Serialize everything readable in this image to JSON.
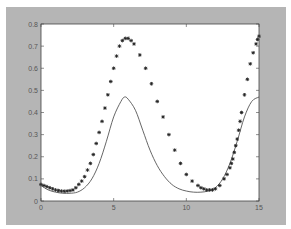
{
  "figure": {
    "frame_color": "#b5b5b5",
    "plot_bg": "#ffffff",
    "axis_color": "#444444",
    "line_color": "#555555",
    "marker_color": "#222222"
  },
  "chart_data": {
    "type": "line",
    "title": "",
    "xlabel": "",
    "ylabel": "",
    "xlim": [
      0,
      15
    ],
    "ylim": [
      0,
      0.8
    ],
    "grid": false,
    "legend": null,
    "xticks": [
      0,
      5,
      10,
      15
    ],
    "xtick_labels": [
      "0",
      "5",
      "10",
      "15"
    ],
    "yticks": [
      0,
      0.1,
      0.2,
      0.3,
      0.4,
      0.5,
      0.6,
      0.7,
      0.8
    ],
    "ytick_labels": [
      "0",
      "0.1",
      "0.2",
      "0.3",
      "0.4",
      "0.5",
      "0.6",
      "0.7",
      "0.8"
    ],
    "series": [
      {
        "name": "line",
        "style": "solid-line",
        "x": [
          0,
          0.5,
          1,
          1.5,
          2,
          2.5,
          3,
          3.5,
          4,
          4.5,
          5,
          5.5,
          5.75,
          6,
          6.5,
          7,
          7.5,
          8,
          8.5,
          9,
          9.5,
          10,
          10.5,
          11,
          11.5,
          12,
          12.5,
          13,
          13.5,
          14,
          14.5,
          15
        ],
        "values": [
          0.07,
          0.05,
          0.04,
          0.035,
          0.035,
          0.04,
          0.06,
          0.1,
          0.17,
          0.27,
          0.38,
          0.45,
          0.47,
          0.46,
          0.41,
          0.32,
          0.23,
          0.16,
          0.11,
          0.075,
          0.055,
          0.045,
          0.04,
          0.04,
          0.045,
          0.06,
          0.1,
          0.17,
          0.27,
          0.38,
          0.45,
          0.47
        ]
      },
      {
        "name": "markers",
        "style": "plus-markers",
        "x": [
          0,
          0.2,
          0.4,
          0.6,
          0.8,
          1.0,
          1.2,
          1.4,
          1.6,
          1.8,
          2.0,
          2.2,
          2.4,
          2.6,
          2.8,
          3.0,
          3.2,
          3.4,
          3.6,
          3.8,
          4.0,
          4.2,
          4.4,
          4.6,
          4.8,
          5.0,
          5.2,
          5.4,
          5.6,
          5.8,
          6.0,
          6.2,
          6.4,
          6.8,
          7.2,
          7.6,
          8.0,
          8.4,
          8.8,
          9.2,
          9.6,
          10.0,
          10.4,
          10.8,
          11.0,
          11.2,
          11.4,
          11.6,
          11.8,
          12.0,
          12.3,
          12.6,
          12.8,
          13.0,
          13.1,
          13.2,
          13.3,
          13.4,
          13.5,
          13.6,
          13.7,
          13.8,
          14.0,
          14.2,
          14.4,
          14.6,
          14.8,
          14.9,
          15.0
        ],
        "values": [
          0.075,
          0.07,
          0.065,
          0.06,
          0.055,
          0.05,
          0.047,
          0.045,
          0.044,
          0.045,
          0.047,
          0.05,
          0.06,
          0.075,
          0.09,
          0.11,
          0.14,
          0.17,
          0.21,
          0.26,
          0.31,
          0.36,
          0.42,
          0.48,
          0.54,
          0.6,
          0.655,
          0.7,
          0.725,
          0.735,
          0.735,
          0.725,
          0.71,
          0.66,
          0.6,
          0.53,
          0.45,
          0.38,
          0.3,
          0.23,
          0.17,
          0.12,
          0.09,
          0.07,
          0.06,
          0.055,
          0.05,
          0.05,
          0.05,
          0.055,
          0.07,
          0.1,
          0.12,
          0.15,
          0.17,
          0.19,
          0.22,
          0.25,
          0.28,
          0.32,
          0.36,
          0.4,
          0.48,
          0.55,
          0.62,
          0.67,
          0.71,
          0.73,
          0.745
        ]
      }
    ]
  }
}
